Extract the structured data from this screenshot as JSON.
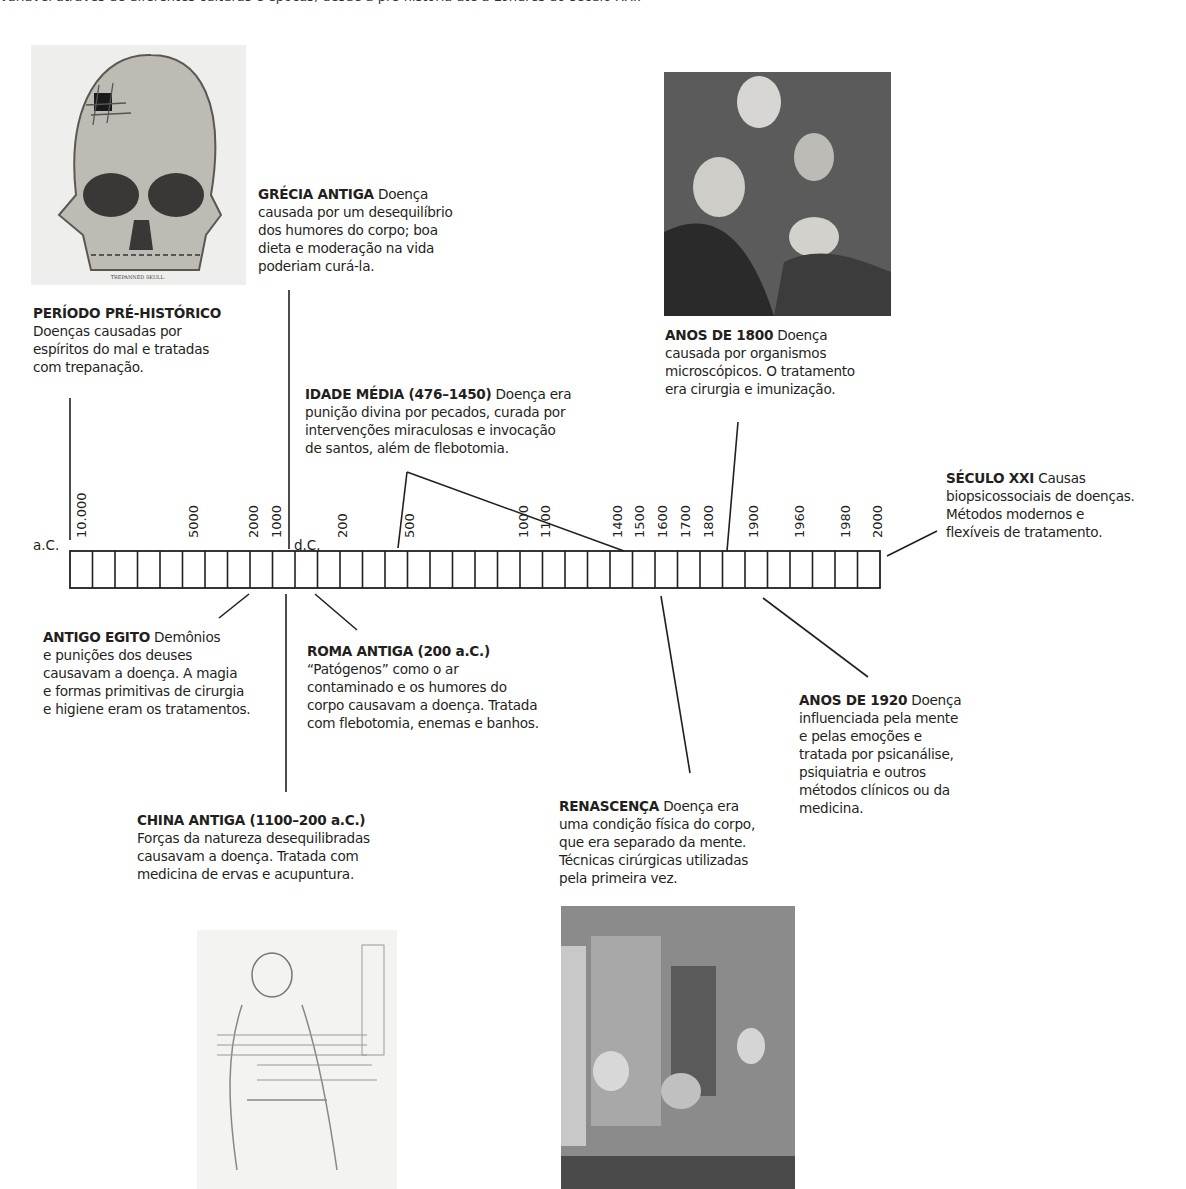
{
  "header_fragment": "variável através de diferentes culturas e épocas, desde a pré-história até a Londres do século XXI.",
  "timeline": {
    "era_bc_label": "a.C.",
    "era_ad_label": "d.C.",
    "ticks_bc": [
      "10.000",
      "5000",
      "2000",
      "1000"
    ],
    "ticks_ad": [
      "200",
      "500",
      "1000",
      "1100",
      "1400",
      "1500",
      "1600",
      "1700",
      "1800",
      "1900",
      "1960",
      "1980",
      "2000"
    ],
    "cell_count": 36
  },
  "entries": {
    "prehistoric": {
      "title": "PERÍODO PRÉ-HISTÓRICO",
      "lines": [
        "Doenças causadas por",
        "espíritos do mal e tratadas",
        "com trepanação."
      ]
    },
    "greece": {
      "title": "GRÉCIA ANTIGA",
      "title_tail": "Doença",
      "lines": [
        "causada por um desequilíbrio",
        "dos humores do corpo; boa",
        "dieta e moderação na vida",
        "poderiam curá-la."
      ]
    },
    "middle_ages": {
      "title": "IDADE MÉDIA (476–1450)",
      "title_tail": "Doença era",
      "lines": [
        "punição divina por pecados, curada por",
        "intervenções miraculosas e invocação",
        "de santos, além de flebotomia."
      ]
    },
    "1800s": {
      "title": "ANOS DE 1800",
      "title_tail": "Doença",
      "lines": [
        "causada por organismos",
        "microscópicos. O tratamento",
        "era cirurgia e imunização."
      ]
    },
    "21st_century": {
      "title": "SÉCULO XXI",
      "title_tail": "Causas",
      "lines": [
        "biopsicossociais de doenças.",
        "Métodos modernos e",
        "flexíveis de tratamento."
      ]
    },
    "egypt": {
      "title": "ANTIGO EGITO",
      "title_tail": "Demônios",
      "lines": [
        "e punições dos deuses",
        "causavam a doença. A magia",
        "e formas primitivas de cirurgia",
        "e higiene eram os tratamentos."
      ]
    },
    "rome": {
      "title": "ROMA ANTIGA (200 a.C.)",
      "lines": [
        "“Patógenos” como o ar",
        "contaminado e os humores do",
        "corpo causavam a doença. Tratada",
        "com flebotomia, enemas e banhos."
      ]
    },
    "1920s": {
      "title": "ANOS DE 1920",
      "title_tail": "Doença",
      "lines": [
        "influenciada pela mente",
        "e pelas emoções e",
        "tratada por psicanálise,",
        "psiquiatria e outros",
        "métodos clínicos ou da",
        "medicina."
      ]
    },
    "china": {
      "title": "CHINA ANTIGA (1100–200 a.C.)",
      "lines": [
        "Forças da natureza desequilibradas",
        "causavam a doença. Tratada com",
        "medicina de ervas e acupuntura."
      ]
    },
    "renaissance": {
      "title": "RENASCENÇA",
      "title_tail": "Doença era",
      "lines": [
        "uma condição física do corpo,",
        "que era separado da mente.",
        "Técnicas cirúrgicas utilizadas",
        "pela primeira vez."
      ]
    }
  },
  "images": {
    "skull_caption": "TREPANNED SKULL."
  }
}
